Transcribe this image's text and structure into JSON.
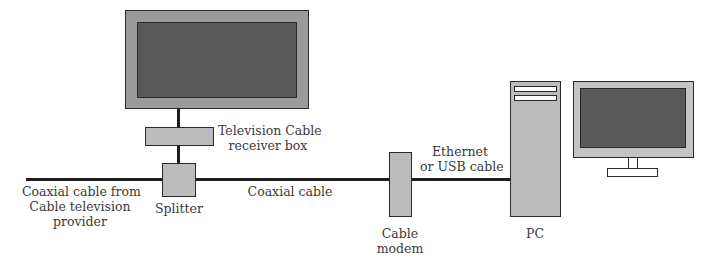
{
  "diagram": {
    "colors": {
      "device_fill": "#bcbcbc",
      "screen_fill": "#5a5a5a",
      "tv_bezel": "#9a9a9a",
      "monitor_bezel": "#c4c4c4",
      "line": "#1e1e1e",
      "text": "#3a3a3a"
    },
    "nodes": [
      {
        "id": "tv",
        "label": ""
      },
      {
        "id": "receiver",
        "label_lines": [
          "Television Cable",
          "receiver box"
        ]
      },
      {
        "id": "splitter",
        "label": "Splitter"
      },
      {
        "id": "modem",
        "label_lines": [
          "Cable",
          "modem"
        ]
      },
      {
        "id": "pc",
        "label": "PC"
      },
      {
        "id": "monitor",
        "label": ""
      }
    ],
    "edges": [
      {
        "from": "provider",
        "to": "splitter",
        "label_lines": [
          "Coaxial cable from",
          "Cable television",
          "provider"
        ]
      },
      {
        "from": "splitter",
        "to": "receiver",
        "label": ""
      },
      {
        "from": "receiver",
        "to": "tv",
        "label": ""
      },
      {
        "from": "splitter",
        "to": "modem",
        "label": "Coaxial cable"
      },
      {
        "from": "modem",
        "to": "pc",
        "label_lines": [
          "Ethernet",
          "or USB cable"
        ]
      }
    ]
  },
  "labels": {
    "receiver_1": "Television Cable",
    "receiver_2": "receiver box",
    "provider_1": "Coaxial cable from",
    "provider_2": "Cable television",
    "provider_3": "provider",
    "splitter": "Splitter",
    "coax": "Coaxial cable",
    "ethernet_1": "Ethernet",
    "ethernet_2": "or USB cable",
    "modem_1": "Cable",
    "modem_2": "modem",
    "pc": "PC"
  }
}
